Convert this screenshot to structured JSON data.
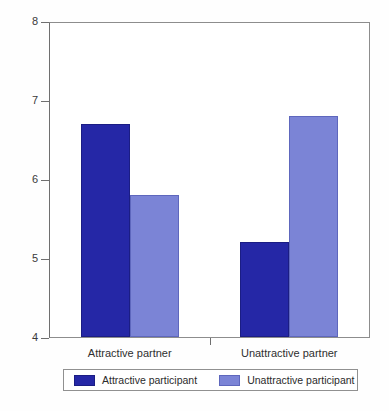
{
  "chart_data": {
    "type": "bar",
    "title": "",
    "xlabel": "",
    "ylabel": "Approach behaviour",
    "ylim": [
      4,
      8
    ],
    "yticks": [
      "8",
      "7",
      "6",
      "5",
      "4"
    ],
    "ytick_values": [
      8,
      7,
      6,
      5,
      4
    ],
    "grid": false,
    "legend_position": "bottom",
    "categories": [
      "Attractive partner",
      "Unattractive partner"
    ],
    "series": [
      {
        "name": "Attractive participant",
        "color": "#2527a6",
        "values": [
          6.7,
          5.2
        ]
      },
      {
        "name": "Unattractive participant",
        "color": "#7b84d6",
        "values": [
          5.8,
          6.8
        ]
      }
    ]
  },
  "legend": {
    "entries": [
      {
        "label": "Attractive participant"
      },
      {
        "label": "Unattractive participant"
      }
    ]
  },
  "axis": {
    "y_title": "Approach behaviour"
  }
}
